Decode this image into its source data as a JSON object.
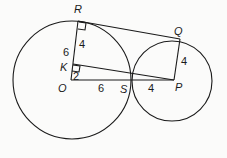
{
  "diagram": {
    "type": "geometry",
    "colors": {
      "stroke": "#1a1a1a",
      "background": "#fbfbfa"
    },
    "points": {
      "R": "R",
      "Q": "Q",
      "K": "K",
      "O": "O",
      "S": "S",
      "P": "P"
    },
    "lengths": {
      "RK": "4",
      "RO": "6",
      "KO": "2",
      "OS": "6",
      "SP": "4",
      "QP": "4"
    }
  }
}
